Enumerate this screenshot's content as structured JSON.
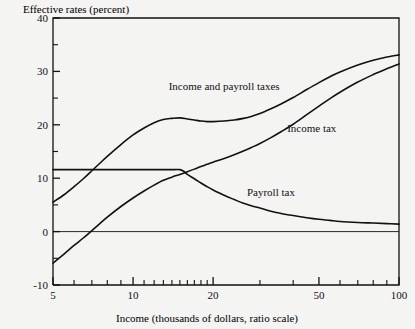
{
  "chart_data": {
    "type": "line",
    "title": "Effective rates (percent)",
    "ylabel": "Effective rates (percent)",
    "xlabel": "Income (thousands of dollars, ratio scale)",
    "xscale": "log",
    "xlim": [
      5,
      100
    ],
    "ylim": [
      -10,
      40
    ],
    "grid": false,
    "legend_position": "inline-annotations",
    "x_ticks_major": [
      5,
      10,
      20,
      50,
      100
    ],
    "x_tick_labels": [
      "5",
      "10",
      "20",
      "50",
      "100"
    ],
    "x_ticks_minor": [
      6,
      7,
      8,
      9,
      11,
      12,
      13,
      14,
      15,
      16,
      17,
      18,
      19,
      30,
      40,
      60,
      70,
      80,
      90
    ],
    "y_ticks_major": [
      -10,
      0,
      10,
      20,
      30,
      40
    ],
    "y_tick_labels": [
      "-10",
      "0",
      "10",
      "20",
      "30",
      "40"
    ],
    "y_ticks_minor": [
      -5,
      5,
      15,
      25,
      35
    ],
    "zero_line": 0,
    "series": [
      {
        "name": "Income and payroll taxes",
        "label": "Income and payroll taxes",
        "label_x": 22,
        "label_y": 26.6,
        "x": [
          5,
          5.5,
          6,
          6.5,
          7,
          7.5,
          8,
          9,
          10,
          11,
          12,
          13,
          14,
          15,
          16,
          17,
          18,
          19,
          20,
          22,
          24,
          26,
          28,
          30,
          33,
          36,
          40,
          45,
          50,
          55,
          60,
          70,
          80,
          90,
          100
        ],
        "values": [
          5.5,
          6.9,
          8.4,
          9.9,
          11.4,
          12.8,
          14.1,
          16.3,
          18.1,
          19.4,
          20.4,
          21.0,
          21.2,
          21.3,
          21.1,
          20.9,
          20.7,
          20.6,
          20.6,
          20.7,
          20.9,
          21.2,
          21.6,
          22.1,
          23.0,
          23.9,
          25.1,
          26.6,
          27.9,
          29.0,
          29.9,
          31.2,
          32.1,
          32.7,
          33.1
        ]
      },
      {
        "name": "Income tax",
        "label": "Income tax",
        "label_x": 47,
        "label_y": 18.6,
        "x": [
          5,
          5.5,
          6,
          6.5,
          7,
          7.5,
          8,
          9,
          10,
          11,
          12,
          13,
          14,
          15,
          16,
          17,
          18,
          19,
          20,
          22,
          24,
          26,
          28,
          30,
          33,
          36,
          40,
          45,
          50,
          55,
          60,
          70,
          80,
          90,
          100
        ],
        "values": [
          -5.9,
          -4.2,
          -2.6,
          -1.2,
          0.2,
          1.5,
          2.7,
          4.7,
          6.3,
          7.6,
          8.7,
          9.6,
          10.2,
          10.7,
          11.2,
          11.7,
          12.2,
          12.6,
          13.0,
          13.7,
          14.4,
          15.1,
          15.8,
          16.5,
          17.6,
          18.7,
          20.1,
          21.9,
          23.5,
          24.9,
          26.1,
          28.0,
          29.4,
          30.5,
          31.4
        ]
      },
      {
        "name": "Payroll tax",
        "label": "Payroll tax",
        "label_x": 33,
        "label_y": 6.6,
        "x": [
          5,
          6,
          7,
          8,
          9,
          10,
          11,
          12,
          13,
          14,
          15,
          15.5,
          16,
          17,
          18,
          19,
          20,
          22,
          24,
          26,
          28,
          30,
          33,
          36,
          40,
          45,
          50,
          55,
          60,
          70,
          80,
          90,
          100
        ],
        "values": [
          11.6,
          11.6,
          11.6,
          11.6,
          11.6,
          11.6,
          11.6,
          11.6,
          11.6,
          11.6,
          11.6,
          11.3,
          10.7,
          9.9,
          9.1,
          8.4,
          7.8,
          6.8,
          6.0,
          5.3,
          4.8,
          4.4,
          3.8,
          3.4,
          3.0,
          2.6,
          2.3,
          2.1,
          1.9,
          1.7,
          1.6,
          1.5,
          1.4
        ]
      }
    ]
  }
}
